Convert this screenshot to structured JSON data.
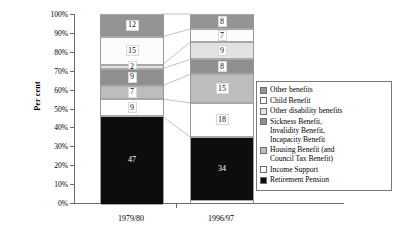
{
  "chart_data": {
    "type": "bar",
    "subtype": "stacked-100-percent",
    "title": "",
    "xlabel": "",
    "ylabel": "Per cent",
    "ylim": [
      0,
      100
    ],
    "ytick_labels": [
      "0%",
      "10%",
      "20%",
      "30%",
      "40%",
      "50%",
      "60%",
      "70%",
      "80%",
      "90%",
      "100%"
    ],
    "ytick_values": [
      0,
      10,
      20,
      30,
      40,
      50,
      60,
      70,
      80,
      90,
      100
    ],
    "grid": false,
    "legend_position": "right",
    "categories": [
      "1979/80",
      "1996/97"
    ],
    "series": [
      {
        "name": "Retirement Pension",
        "values": [
          47,
          34
        ],
        "color": "#0d0d0d"
      },
      {
        "name": "Income Support",
        "values": [
          9,
          18
        ],
        "color": "#ffffff"
      },
      {
        "name": "Housing Benefit (and\nCouncil Tax Benefit)",
        "values": [
          7,
          15
        ],
        "color": "#bdbdbd"
      },
      {
        "name": "Sickness Benefit,\nInvalidity Benefit,\nIncapacity Benefit",
        "values": [
          9,
          8
        ],
        "color": "#8f8f8f"
      },
      {
        "name": "Other disability benefits",
        "values": [
          2,
          9
        ],
        "color": "#e2e2e2"
      },
      {
        "name": "Child Benefit",
        "values": [
          15,
          7
        ],
        "color": "#fcfcfc"
      },
      {
        "name": "Other benefits",
        "values": [
          12,
          8
        ],
        "color": "#949494"
      }
    ],
    "legend_entries": [
      {
        "label": "Other benefits",
        "color": "#949494"
      },
      {
        "label": "Child Benefit",
        "color": "#fcfcfc"
      },
      {
        "label": "Other disability benefits",
        "color": "#e2e2e2"
      },
      {
        "label": "Sickness Benefit,\nInvalidity Benefit,\nIncapacity Benefit",
        "color": "#8f8f8f"
      },
      {
        "label": "Housing Benefit (and\nCouncil Tax Benefit)",
        "color": "#bdbdbd"
      },
      {
        "label": "Income Support",
        "color": "#ffffff"
      },
      {
        "label": "Retirement Pension",
        "color": "#0d0d0d"
      }
    ],
    "bars": [
      {
        "category": "1979/80",
        "segments": [
          {
            "name": "Other benefits",
            "value": 12,
            "color": "#949494"
          },
          {
            "name": "Child Benefit",
            "value": 15,
            "color": "#fcfcfc"
          },
          {
            "name": "Other disability benefits",
            "value": 2,
            "color": "#e2e2e2"
          },
          {
            "name": "Sickness Benefit, Invalidity Benefit, Incapacity Benefit",
            "value": 9,
            "color": "#8f8f8f"
          },
          {
            "name": "Housing Benefit (and Council Tax Benefit)",
            "value": 7,
            "color": "#bdbdbd"
          },
          {
            "name": "Income Support",
            "value": 9,
            "color": "#ffffff"
          },
          {
            "name": "Retirement Pension",
            "value": 47,
            "color": "#0d0d0d"
          }
        ]
      },
      {
        "category": "1996/97",
        "segments": [
          {
            "name": "Other benefits",
            "value": 8,
            "color": "#949494"
          },
          {
            "name": "Child Benefit",
            "value": 7,
            "color": "#fcfcfc"
          },
          {
            "name": "Other disability benefits",
            "value": 9,
            "color": "#e2e2e2"
          },
          {
            "name": "Sickness Benefit, Invalidity Benefit, Incapacity Benefit",
            "value": 8,
            "color": "#8f8f8f"
          },
          {
            "name": "Housing Benefit (and Council Tax Benefit)",
            "value": 15,
            "color": "#bdbdbd"
          },
          {
            "name": "Income Support",
            "value": 18,
            "color": "#ffffff"
          },
          {
            "name": "Retirement Pension",
            "value": 34,
            "color": "#0d0d0d"
          }
        ]
      }
    ]
  }
}
